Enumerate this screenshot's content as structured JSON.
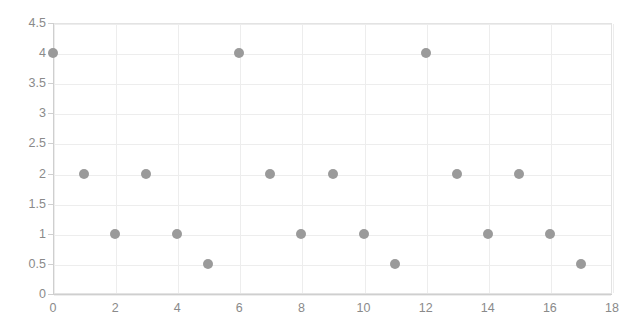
{
  "chart_data": {
    "type": "scatter",
    "title": "",
    "subtitle": "",
    "xlabel": "",
    "ylabel": "",
    "xlim": [
      0,
      18
    ],
    "ylim": [
      0,
      4.5
    ],
    "x_tick_step": 2,
    "y_tick_step": 0.5,
    "x_ticks": [
      "0",
      "2",
      "4",
      "6",
      "8",
      "10",
      "12",
      "14",
      "16",
      "18"
    ],
    "y_ticks": [
      "0",
      "0.5",
      "1",
      "1.5",
      "2",
      "2.5",
      "3",
      "3.5",
      "4",
      "4.5"
    ],
    "grid": true,
    "grid_horizontal_step": 0.5,
    "grid_vertical_step": 2,
    "legend": false,
    "legend_position": "none",
    "marker": "circle",
    "marker_color": "#9a9a9a",
    "marker_size_px": 10,
    "axis_color": "#cfcfcf",
    "grid_color": "#ededed",
    "tick_label_color": "#8a8a8a",
    "background_color": "#ffffff",
    "x": [
      0,
      1,
      2,
      3,
      4,
      5,
      6,
      7,
      8,
      9,
      10,
      11,
      12,
      13,
      14,
      15,
      16,
      17
    ],
    "values": [
      4,
      2,
      1,
      2,
      1,
      0.5,
      4,
      2,
      1,
      2,
      1,
      0.5,
      4,
      2,
      1,
      2,
      1,
      0.5
    ],
    "points": [
      {
        "x": 0,
        "y": 4
      },
      {
        "x": 1,
        "y": 2
      },
      {
        "x": 2,
        "y": 1
      },
      {
        "x": 3,
        "y": 2
      },
      {
        "x": 4,
        "y": 1
      },
      {
        "x": 5,
        "y": 0.5
      },
      {
        "x": 6,
        "y": 4
      },
      {
        "x": 7,
        "y": 2
      },
      {
        "x": 8,
        "y": 1
      },
      {
        "x": 9,
        "y": 2
      },
      {
        "x": 10,
        "y": 1
      },
      {
        "x": 11,
        "y": 0.5
      },
      {
        "x": 12,
        "y": 4
      },
      {
        "x": 13,
        "y": 2
      },
      {
        "x": 14,
        "y": 1
      },
      {
        "x": 15,
        "y": 2
      },
      {
        "x": 16,
        "y": 1
      },
      {
        "x": 17,
        "y": 0.5
      }
    ]
  }
}
